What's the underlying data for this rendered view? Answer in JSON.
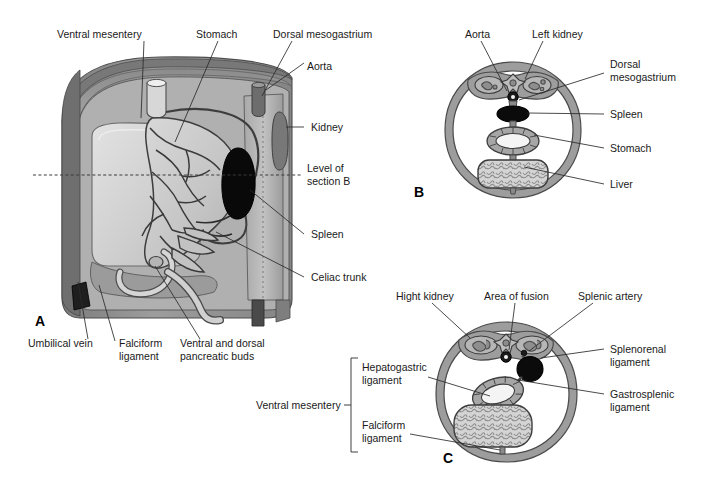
{
  "figure": {
    "panels": [
      {
        "id": "A",
        "letter": "A",
        "letter_x": 35,
        "letter_y": 325,
        "labels": [
          {
            "name": "ventral-mesentery",
            "text": "Ventral mesentery",
            "x": 57,
            "y": 34,
            "anchor": "start",
            "leader": "M 144 39 L 141 118"
          },
          {
            "name": "stomach",
            "text": "Stomach",
            "x": 196,
            "y": 34,
            "anchor": "start",
            "leader": "M 218 39 L 175 140"
          },
          {
            "name": "dorsal-mesogastrium",
            "text": "Dorsal mesogastrium",
            "x": 273,
            "y": 34,
            "anchor": "start",
            "leader": "M 292 39 L 263 95"
          },
          {
            "name": "aorta",
            "text": "Aorta",
            "x": 307,
            "y": 66,
            "anchor": "start",
            "leader": "M 305 62 L 264 90"
          },
          {
            "name": "kidney",
            "text": "Kidney",
            "x": 307,
            "y": 130,
            "anchor": "start",
            "leader": "M 304 127 L 284 127"
          },
          {
            "name": "level-of-section-b-line1",
            "text": "Level of",
            "x": 307,
            "y": 171,
            "anchor": "start",
            "leader": ""
          },
          {
            "name": "level-of-section-b-line2",
            "text": "section B",
            "x": 307,
            "y": 184,
            "anchor": "start",
            "leader": ""
          },
          {
            "name": "spleen",
            "text": "Spleen",
            "x": 307,
            "y": 238,
            "anchor": "start",
            "leader": "M 304 234 L 249 188"
          },
          {
            "name": "celiac-trunk",
            "text": "Celiac trunk",
            "x": 307,
            "y": 281,
            "anchor": "start",
            "leader": "M 304 277 L 218 232"
          },
          {
            "name": "umbilical-vein",
            "text": "Umbilical vein",
            "x": 28,
            "y": 347,
            "anchor": "start",
            "leader": "M 88 339 L 79 277"
          },
          {
            "name": "falciform-ligament-line1",
            "text": "Falciform",
            "x": 119,
            "y": 347,
            "anchor": "start",
            "leader": "M 115 341 L 98 283"
          },
          {
            "name": "falciform-ligament-line2",
            "text": "ligament",
            "x": 119,
            "y": 360,
            "anchor": "start",
            "leader": ""
          },
          {
            "name": "pancreatic-buds-line1",
            "text": "Ventral and dorsal",
            "x": 180,
            "y": 347,
            "anchor": "start",
            "leader": "M 200 339 L 154 265"
          },
          {
            "name": "pancreatic-buds-line2",
            "text": "pancreatic buds",
            "x": 180,
            "y": 360,
            "anchor": "start",
            "leader": ""
          }
        ],
        "section_line": {
          "name": "level-of-section-b-dashed-line",
          "x1": 33,
          "y1": 175,
          "x2": 303,
          "y2": 175
        }
      },
      {
        "id": "B",
        "letter": "B",
        "letter_x": 414,
        "letter_y": 196,
        "labels": [
          {
            "name": "aorta",
            "text": "Aorta",
            "x": 465,
            "y": 34,
            "anchor": "start",
            "leader": "M 481 39 L 504 89"
          },
          {
            "name": "left-kidney",
            "text": "Left kidney",
            "x": 532,
            "y": 34,
            "anchor": "start",
            "leader": "M 543 39 L 522 80"
          },
          {
            "name": "dorsal-mesogastrium-line1",
            "text": "Dorsal",
            "x": 608,
            "y": 67,
            "anchor": "start",
            "leader": "M 605 76 L 518 100"
          },
          {
            "name": "dorsal-mesogastrium-line2",
            "text": "mesogastrium",
            "x": 608,
            "y": 80,
            "anchor": "start",
            "leader": ""
          },
          {
            "name": "spleen",
            "text": "Spleen",
            "x": 608,
            "y": 118,
            "anchor": "start",
            "leader": "M 605 114 L 512 112"
          },
          {
            "name": "stomach",
            "text": "Stomach",
            "x": 608,
            "y": 152,
            "anchor": "start",
            "leader": "M 605 148 L 516 133"
          },
          {
            "name": "liver",
            "text": "Liver",
            "x": 608,
            "y": 188,
            "anchor": "start",
            "leader": "M 605 184 L 518 164"
          }
        ]
      },
      {
        "id": "C",
        "letter": "C",
        "letter_x": 443,
        "letter_y": 462,
        "labels": [
          {
            "name": "right-kidney",
            "text": "Hight kidney",
            "x": 396,
            "y": 296,
            "anchor": "start",
            "leader": "M 432 301 L 466 337"
          },
          {
            "name": "area-of-fusion",
            "text": "Area of fusion",
            "x": 484,
            "y": 296,
            "anchor": "start",
            "leader": "M 513 301 L 509 349"
          },
          {
            "name": "splenic-artery",
            "text": "Splenic artery",
            "x": 578,
            "y": 296,
            "anchor": "start",
            "leader": "M 593 301 L 534 350"
          },
          {
            "name": "splenorenal-ligament-line1",
            "text": "Splenorenal",
            "x": 608,
            "y": 353,
            "anchor": "start",
            "leader": "M 605 349 L 540 355"
          },
          {
            "name": "splenorenal-ligament-line2",
            "text": "ligament",
            "x": 608,
            "y": 366,
            "anchor": "start",
            "leader": ""
          },
          {
            "name": "gastrosplenic-ligament-line1",
            "text": "Gastrosplenic",
            "x": 608,
            "y": 398,
            "anchor": "start",
            "leader": "M 605 394 L 540 380"
          },
          {
            "name": "gastrosplenic-ligament-line2",
            "text": "ligament",
            "x": 608,
            "y": 411,
            "anchor": "start",
            "leader": ""
          },
          {
            "name": "ventral-mesentery",
            "text": "Ventral mesentery",
            "x": 256,
            "y": 409,
            "anchor": "start",
            "leader": ""
          },
          {
            "name": "hepatogastric-ligament-line1",
            "text": "Hepatogastric",
            "x": 360,
            "y": 370,
            "anchor": "start",
            "leader": "M 428 375 L 496 393"
          },
          {
            "name": "hepatogastric-ligament-line2",
            "text": "ligament",
            "x": 360,
            "y": 383,
            "anchor": "start",
            "leader": ""
          },
          {
            "name": "falciform-ligament-line1",
            "text": "Falciform",
            "x": 360,
            "y": 428,
            "anchor": "start",
            "leader": "M 410 433 L 500 451"
          },
          {
            "name": "falciform-ligament-line2",
            "text": "ligament",
            "x": 360,
            "y": 441,
            "anchor": "start",
            "leader": ""
          }
        ],
        "bracket": {
          "name": "ventral-mesentery-bracket",
          "path": "M 360 358 L 353 358 L 353 452 L 360 452",
          "tick": "M 353 405 L 346 405"
        }
      }
    ]
  },
  "colors": {
    "body_wall_outer": "#8e8e8e",
    "body_wall_mid": "#a8a8a8",
    "cavity": "#b9b9b9",
    "organ_light": "#d2d2d2",
    "organ_mid": "#bdbdbd",
    "liver_fill": "#cfcfcf",
    "spleen_dark": "#0a0a0a",
    "outline": "#4a4a4a",
    "text": "#1a1a1a",
    "background": "#ffffff"
  }
}
